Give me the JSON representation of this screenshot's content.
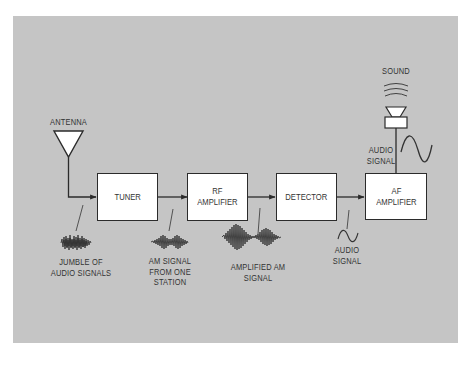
{
  "diagram": {
    "colors": {
      "background": "#ffffff",
      "panel": "#c5c5c5",
      "box_fill": "#ffffff",
      "stroke": "#2b2b2b",
      "text": "#333333"
    },
    "input": {
      "antenna_label": "ANTENNA",
      "antenna_icon": "antenna-triangle-icon"
    },
    "blocks": [
      {
        "id": "tuner",
        "label": "TUNER"
      },
      {
        "id": "rf-amplifier",
        "label": "RF\nAMPLIFIER"
      },
      {
        "id": "detector",
        "label": "DETECTOR"
      },
      {
        "id": "af-amplifier",
        "label": "AF\nAMPLIFIER"
      }
    ],
    "signals": [
      {
        "id": "jumble",
        "label": "JUMBLE OF\nAUDIO SIGNALS",
        "waveform": "noise-burst-icon"
      },
      {
        "id": "am-one-station",
        "label": "AM SIGNAL\nFROM ONE\nSTATION",
        "waveform": "am-wave-small-icon"
      },
      {
        "id": "amplified-am",
        "label": "AMPLIFIED AM\nSIGNAL",
        "waveform": "am-wave-large-icon"
      },
      {
        "id": "audio",
        "label": "AUDIO\nSIGNAL",
        "waveform": "sine-wave-small-icon"
      }
    ],
    "output": {
      "audio_signal_label": "AUDIO\nSIGNAL",
      "waveform": "sine-wave-large-icon",
      "speaker_icon": "speaker-icon",
      "sound_label": "SOUND",
      "sound_icon": "sound-waves-icon"
    }
  }
}
